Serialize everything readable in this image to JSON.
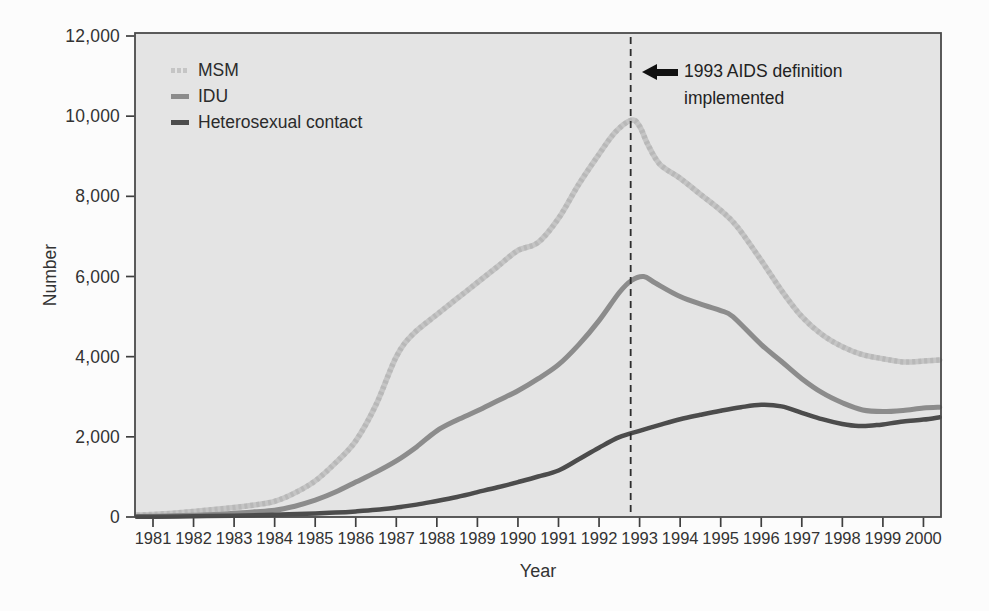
{
  "chart_data": {
    "type": "line",
    "title": "",
    "xlabel": "Year",
    "ylabel": "Number",
    "ylim": [
      0,
      12000
    ],
    "xlim": [
      1980.6,
      2000.4
    ],
    "grid": false,
    "legend_position": "top-left-inside",
    "plot_background": "#e4e4e4",
    "border_color": "#4a4a4a",
    "y_ticks": [
      {
        "value": 0,
        "label": "0"
      },
      {
        "value": 2000,
        "label": "2,000"
      },
      {
        "value": 4000,
        "label": "4,000"
      },
      {
        "value": 6000,
        "label": "6,000"
      },
      {
        "value": 8000,
        "label": "8,000"
      },
      {
        "value": 10000,
        "label": "10,000"
      },
      {
        "value": 12000,
        "label": "12,000"
      }
    ],
    "x_ticks": [
      "1981",
      "1982",
      "1983",
      "1984",
      "1985",
      "1986",
      "1987",
      "1988",
      "1989",
      "1990",
      "1991",
      "1992",
      "1993",
      "1994",
      "1995",
      "1996",
      "1997",
      "1998",
      "1999",
      "2000"
    ],
    "reference_line": {
      "x": 1992.78,
      "style": "dashed",
      "color": "#2d2d2d"
    },
    "annotation": {
      "line1": "1993 AIDS definition",
      "line2": "implemented",
      "icon": "left-arrow",
      "points_to": "reference-line"
    },
    "series": [
      {
        "id": "msm",
        "name": "MSM",
        "color": "#c5c5c5",
        "texture": "#a9a9a9",
        "swatch": "dashed",
        "line_width": 5.5,
        "points": [
          [
            1980.6,
            50
          ],
          [
            1981,
            65
          ],
          [
            1981.5,
            95
          ],
          [
            1982,
            140
          ],
          [
            1982.5,
            185
          ],
          [
            1983,
            235
          ],
          [
            1983.5,
            300
          ],
          [
            1984,
            390
          ],
          [
            1984.5,
            600
          ],
          [
            1985,
            900
          ],
          [
            1985.5,
            1350
          ],
          [
            1986,
            1900
          ],
          [
            1986.5,
            2800
          ],
          [
            1987,
            4000
          ],
          [
            1987.4,
            4550
          ],
          [
            1988,
            5050
          ],
          [
            1988.5,
            5450
          ],
          [
            1989,
            5850
          ],
          [
            1989.5,
            6250
          ],
          [
            1990,
            6650
          ],
          [
            1990.5,
            6850
          ],
          [
            1991,
            7450
          ],
          [
            1991.5,
            8300
          ],
          [
            1992,
            9050
          ],
          [
            1992.4,
            9600
          ],
          [
            1992.8,
            9900
          ],
          [
            1993,
            9750
          ],
          [
            1993.2,
            9300
          ],
          [
            1993.5,
            8800
          ],
          [
            1994,
            8450
          ],
          [
            1994.5,
            8050
          ],
          [
            1995,
            7650
          ],
          [
            1995.4,
            7250
          ],
          [
            1996,
            6400
          ],
          [
            1996.5,
            5650
          ],
          [
            1997,
            5000
          ],
          [
            1997.5,
            4550
          ],
          [
            1998,
            4250
          ],
          [
            1998.5,
            4050
          ],
          [
            1999,
            3950
          ],
          [
            1999.5,
            3870
          ],
          [
            2000,
            3890
          ],
          [
            2000.4,
            3920
          ]
        ]
      },
      {
        "id": "idu",
        "name": "IDU",
        "color": "#8c8c8c",
        "swatch": "solid",
        "line_width": 5,
        "points": [
          [
            1980.6,
            15
          ],
          [
            1981,
            20
          ],
          [
            1981.5,
            30
          ],
          [
            1982,
            45
          ],
          [
            1982.5,
            65
          ],
          [
            1983,
            95
          ],
          [
            1983.5,
            130
          ],
          [
            1984,
            170
          ],
          [
            1984.5,
            270
          ],
          [
            1985,
            420
          ],
          [
            1985.5,
            620
          ],
          [
            1986,
            870
          ],
          [
            1986.5,
            1120
          ],
          [
            1987,
            1400
          ],
          [
            1987.5,
            1750
          ],
          [
            1988,
            2150
          ],
          [
            1988.5,
            2420
          ],
          [
            1989,
            2650
          ],
          [
            1989.5,
            2900
          ],
          [
            1990,
            3150
          ],
          [
            1990.5,
            3450
          ],
          [
            1991,
            3800
          ],
          [
            1991.5,
            4300
          ],
          [
            1992,
            4900
          ],
          [
            1992.5,
            5600
          ],
          [
            1992.8,
            5900
          ],
          [
            1993.1,
            6000
          ],
          [
            1993.4,
            5830
          ],
          [
            1994,
            5500
          ],
          [
            1994.6,
            5280
          ],
          [
            1995,
            5150
          ],
          [
            1995.3,
            5000
          ],
          [
            1996,
            4300
          ],
          [
            1996.5,
            3880
          ],
          [
            1997,
            3450
          ],
          [
            1997.5,
            3100
          ],
          [
            1998,
            2850
          ],
          [
            1998.5,
            2670
          ],
          [
            1999,
            2630
          ],
          [
            1999.5,
            2660
          ],
          [
            2000,
            2720
          ],
          [
            2000.4,
            2740
          ]
        ]
      },
      {
        "id": "heterosexual-contact",
        "name": "Heterosexual contact",
        "color": "#4c4c4c",
        "swatch": "solid",
        "line_width": 4.5,
        "points": [
          [
            1980.6,
            5
          ],
          [
            1981,
            8
          ],
          [
            1982,
            18
          ],
          [
            1983,
            32
          ],
          [
            1984,
            55
          ],
          [
            1985,
            90
          ],
          [
            1985.5,
            110
          ],
          [
            1986,
            140
          ],
          [
            1986.5,
            180
          ],
          [
            1987,
            235
          ],
          [
            1987.5,
            310
          ],
          [
            1988,
            400
          ],
          [
            1988.5,
            500
          ],
          [
            1989,
            620
          ],
          [
            1989.5,
            740
          ],
          [
            1990,
            870
          ],
          [
            1990.5,
            1010
          ],
          [
            1991,
            1160
          ],
          [
            1991.5,
            1440
          ],
          [
            1992,
            1730
          ],
          [
            1992.5,
            1990
          ],
          [
            1993,
            2150
          ],
          [
            1993.5,
            2300
          ],
          [
            1994,
            2440
          ],
          [
            1994.5,
            2550
          ],
          [
            1995,
            2650
          ],
          [
            1995.5,
            2740
          ],
          [
            1996,
            2800
          ],
          [
            1996.5,
            2760
          ],
          [
            1997,
            2600
          ],
          [
            1997.5,
            2440
          ],
          [
            1998,
            2320
          ],
          [
            1998.4,
            2270
          ],
          [
            1998.8,
            2290
          ],
          [
            1999,
            2310
          ],
          [
            1999.5,
            2380
          ],
          [
            2000,
            2430
          ],
          [
            2000.4,
            2490
          ]
        ]
      }
    ]
  }
}
